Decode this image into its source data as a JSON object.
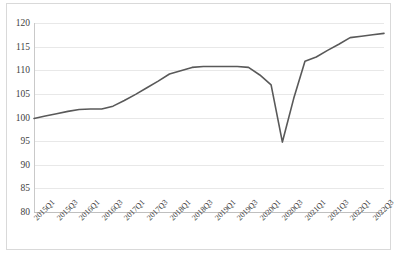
{
  "chart_data": {
    "type": "line",
    "title": "",
    "xlabel": "",
    "ylabel": "",
    "ylim": [
      80,
      120
    ],
    "yticks": [
      80,
      85,
      90,
      95,
      100,
      105,
      110,
      115,
      120
    ],
    "grid": true,
    "legend": "none",
    "line_color": "#595959",
    "categories": [
      "2015Q1",
      "2015Q2",
      "2015Q3",
      "2015Q4",
      "2016Q1",
      "2016Q2",
      "2016Q3",
      "2016Q4",
      "2017Q1",
      "2017Q2",
      "2017Q3",
      "2017Q4",
      "2018Q1",
      "2018Q2",
      "2018Q3",
      "2018Q4",
      "2019Q1",
      "2019Q2",
      "2019Q3",
      "2019Q4",
      "2020Q1",
      "2020Q2",
      "2020Q3",
      "2020Q4",
      "2021Q1",
      "2021Q2",
      "2021Q3",
      "2021Q4",
      "2022Q1",
      "2022Q2",
      "2022Q3",
      "2022Q4"
    ],
    "tick_labels": [
      "2015Q1",
      "2015Q3",
      "2016Q1",
      "2016Q3",
      "2017Q1",
      "2017Q3",
      "2018Q1",
      "2018Q3",
      "2019Q1",
      "2019Q3",
      "2020Q1",
      "2020Q3",
      "2021Q1",
      "2021Q3",
      "2022Q1",
      "2022Q3"
    ],
    "values": [
      99.8,
      100.3,
      100.8,
      101.3,
      101.7,
      101.8,
      101.8,
      102.4,
      103.6,
      104.9,
      106.3,
      107.7,
      109.2,
      109.9,
      110.6,
      110.8,
      110.8,
      110.8,
      110.8,
      110.6,
      109.0,
      106.9,
      94.8,
      104.0,
      111.9,
      112.8,
      114.2,
      115.5,
      116.9,
      117.2,
      117.5,
      117.8
    ]
  }
}
